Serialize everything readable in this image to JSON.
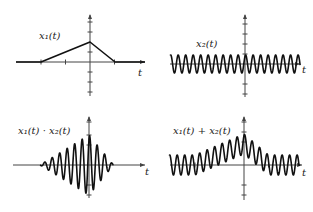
{
  "chart_data": [
    {
      "type": "line",
      "title": "x1(t)",
      "label": "x₁(t)",
      "xlabel": "t",
      "description": "Triangular pulse: 0 for t < -2, rises linearly to peak at t=0, falls linearly to 0 at t=1",
      "x": [
        -3,
        -2,
        0,
        1,
        2
      ],
      "values": [
        0,
        0,
        1,
        0,
        0
      ],
      "xlim": [
        -3,
        2.2
      ],
      "ylim": [
        -2,
        2
      ]
    },
    {
      "type": "line",
      "title": "x2(t)",
      "label": "x₂(t)",
      "xlabel": "t",
      "description": "Constant-amplitude sinusoid, about 17 cycles across the window",
      "amplitude": 1,
      "cycles": 17,
      "xlim": [
        -3,
        2.2
      ],
      "ylim": [
        -2,
        2
      ]
    },
    {
      "type": "line",
      "title": "x1(t) · x2(t)",
      "label": "x₁(t) · x₂(t)",
      "xlabel": "t",
      "description": "Product: sinusoid modulated by the triangular envelope (zero outside [-2, 1])",
      "xlim": [
        -3,
        2.2
      ],
      "ylim": [
        -2,
        2
      ]
    },
    {
      "type": "line",
      "title": "x1(t) + x2(t)",
      "label": "x₁(t) + x₂(t)",
      "xlabel": "t",
      "description": "Sum: sinusoid riding on the triangular pulse",
      "xlim": [
        -3,
        2.2
      ],
      "ylim": [
        -2,
        2
      ]
    }
  ],
  "panels": {
    "p1": {
      "label": "x₁(t)",
      "t": "t"
    },
    "p2": {
      "label": "x₂(t)",
      "t": "t"
    },
    "p3": {
      "label": "x₁(t) · x₂(t)",
      "t": "t"
    },
    "p4": {
      "label": "x₁(t) + x₂(t)",
      "t": "t"
    }
  }
}
